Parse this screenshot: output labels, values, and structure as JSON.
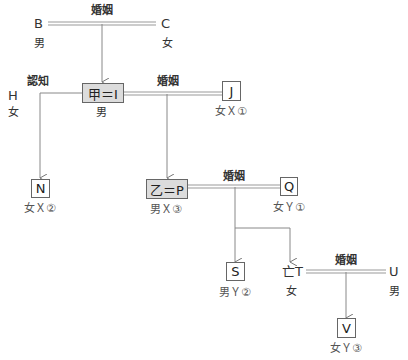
{
  "relations": {
    "marriage_label": "婚姻",
    "acknowledgment_label": "認知"
  },
  "persons": {
    "B": {
      "name": "B",
      "gender": "男"
    },
    "C": {
      "name": "C",
      "gender": "女"
    },
    "H": {
      "name": "H",
      "gender": "女"
    },
    "I": {
      "name": "甲＝I",
      "gender": "男"
    },
    "J": {
      "name": "J",
      "tag": "女Ｘ①"
    },
    "N": {
      "name": "N",
      "tag": "女Ｘ②"
    },
    "P": {
      "name": "乙＝P",
      "tag": "男Ｘ③"
    },
    "Q": {
      "name": "Q",
      "tag": "女Ｙ①"
    },
    "S": {
      "name": "S",
      "tag": "男Ｙ②"
    },
    "T": {
      "name": "亡T",
      "gender": "女"
    },
    "U": {
      "name": "U",
      "gender": "男"
    },
    "V": {
      "name": "V",
      "tag": "女Ｙ③"
    }
  },
  "colors": {
    "line": "#888888",
    "highlight_box": "#dcdcdc"
  }
}
